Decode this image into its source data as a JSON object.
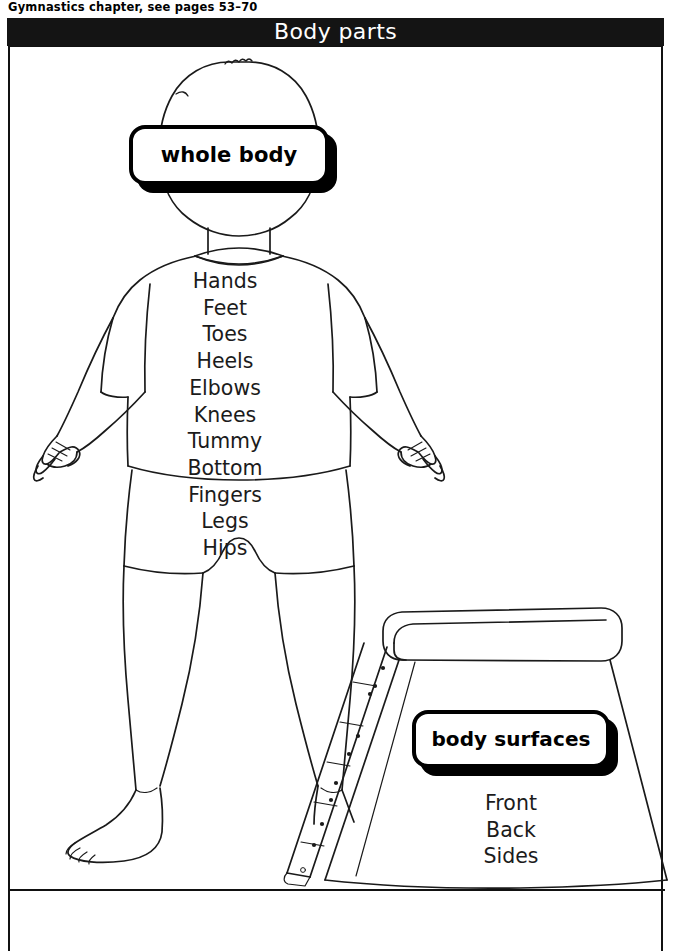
{
  "caption": {
    "text": "Gymnastics chapter, see pages 53–70"
  },
  "header": {
    "title": "Body parts",
    "background_color": "#141414",
    "text_color": "#ffffff"
  },
  "callouts": {
    "whole_body": {
      "label": "whole body"
    },
    "body_surfaces": {
      "label": "body surfaces"
    }
  },
  "lists": {
    "body_parts": [
      "Hands",
      "Feet",
      "Toes",
      "Heels",
      "Elbows",
      "Knees",
      "Tummy",
      "Bottom",
      "Fingers",
      "Legs",
      "Hips"
    ],
    "body_surfaces": [
      "Front",
      "Back",
      "Sides"
    ]
  },
  "illustration": {
    "child_figure": "line-drawing of a child standing, front view, wearing t-shirt and shorts, bare feet",
    "apparatus": "gymnastics vaulting box with padded top and riveted side strip",
    "line_color": "#1a1a1a"
  }
}
